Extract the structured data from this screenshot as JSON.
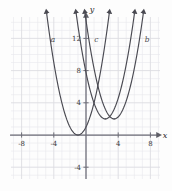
{
  "figure": {
    "kind": "cartesian-graph",
    "background_color": "#fdfdfd",
    "grid_color": "#e8e8ec",
    "grid_major_color": "#dcdce2",
    "axis_color": "#6e6e78",
    "curve_color": "#4a4a52",
    "axis_labels": {
      "x": "x",
      "y": "y"
    }
  },
  "axes": {
    "x_ticks": [
      {
        "value": -8,
        "label": "-8"
      },
      {
        "value": -4,
        "label": "-4"
      },
      {
        "value": 4,
        "label": "4"
      },
      {
        "value": 8,
        "label": "8"
      }
    ],
    "y_ticks": [
      {
        "value": 12,
        "label": "12"
      },
      {
        "value": 8,
        "label": "8"
      },
      {
        "value": 4,
        "label": "4"
      },
      {
        "value": -4,
        "label": "-4"
      }
    ],
    "xlim": [
      -10,
      9.2
    ],
    "ylim": [
      -6.8,
      15.5
    ]
  },
  "chart_data": {
    "type": "line",
    "title": "",
    "xlabel": "x",
    "ylabel": "y",
    "xlim": [
      -10,
      9.2
    ],
    "ylim": [
      -6.8,
      15.5
    ],
    "grid": true,
    "legend": "inline-curve-labels",
    "x_ticks": [
      -8,
      -4,
      4,
      8
    ],
    "y_ticks": [
      12,
      8,
      4,
      -4
    ],
    "series": [
      {
        "name": "a",
        "label": "a",
        "label_x": -4.1,
        "label_y": 11.6,
        "vertex": [
          -1.0,
          0.0
        ],
        "leading_coefficient": 1.0,
        "equation": "y = (x + 1)^2",
        "arrows": "both-ends-up",
        "points": [
          [
            -4.9,
            15.2
          ],
          [
            -4.0,
            9.0
          ],
          [
            -3.0,
            4.0
          ],
          [
            -2.0,
            1.0
          ],
          [
            -1.0,
            0.0
          ],
          [
            0.0,
            1.0
          ],
          [
            1.0,
            4.0
          ],
          [
            2.0,
            9.0
          ],
          [
            2.9,
            15.2
          ]
        ]
      },
      {
        "name": "c",
        "label": "c",
        "label_x": 1.3,
        "label_y": 11.6,
        "vertex": [
          2.4,
          2.0
        ],
        "leading_coefficient": 1.0,
        "equation": "y = (x - 2.4)^2 + 2",
        "arrows": "both-ends-up",
        "points": [
          [
            -1.2,
            15.0
          ],
          [
            -0.6,
            11.0
          ],
          [
            0.4,
            6.0
          ],
          [
            1.4,
            3.0
          ],
          [
            2.4,
            2.0
          ],
          [
            3.4,
            3.0
          ],
          [
            4.4,
            6.0
          ],
          [
            5.4,
            11.0
          ],
          [
            6.0,
            15.0
          ]
        ]
      },
      {
        "name": "b",
        "label": "b",
        "label_x": 7.6,
        "label_y": 11.6,
        "vertex": [
          3.5,
          2.0
        ],
        "leading_coefficient": 1.0,
        "equation": "y = (x - 3.5)^2 + 2",
        "arrows": "both-ends-up",
        "points": [
          [
            -0.1,
            15.0
          ],
          [
            0.5,
            11.0
          ],
          [
            1.5,
            6.0
          ],
          [
            2.5,
            3.0
          ],
          [
            3.5,
            2.0
          ],
          [
            4.5,
            3.0
          ],
          [
            5.5,
            6.0
          ],
          [
            6.5,
            11.0
          ],
          [
            7.1,
            15.0
          ]
        ]
      }
    ]
  }
}
